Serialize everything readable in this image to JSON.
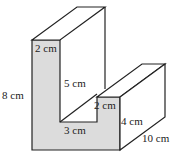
{
  "diagram": {
    "colors": {
      "front_face": "#dcdcdc",
      "edge": "#222222",
      "background": "#ffffff"
    },
    "labels": {
      "top_width": "2 cm",
      "total_height": "8 cm",
      "inner_height": "5 cm",
      "inner_width": "3 cm",
      "step_width": "2 cm",
      "step_height": "4 cm",
      "depth": "10 cm"
    }
  }
}
